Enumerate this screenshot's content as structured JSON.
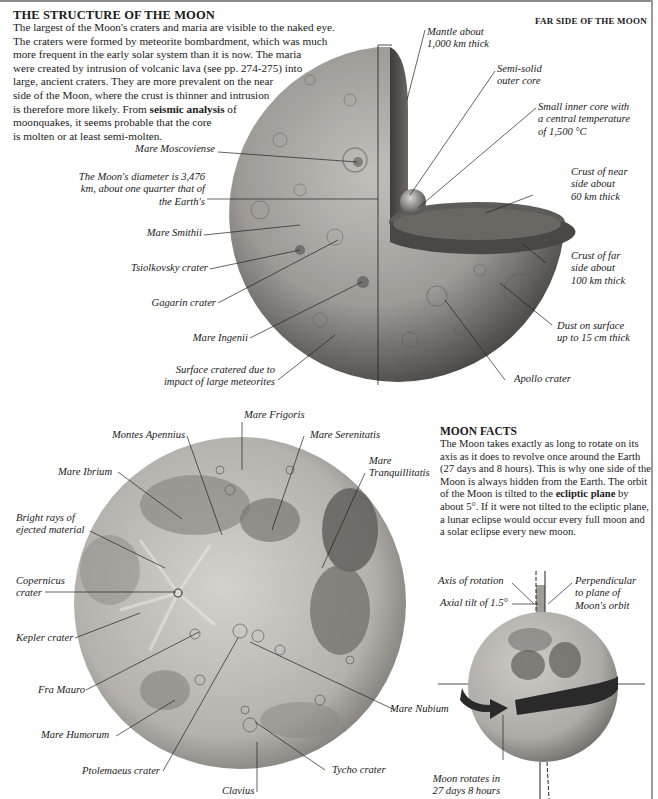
{
  "header": {
    "title": "THE STRUCTURE OF THE MOON",
    "intro_lines": [
      "The largest of the Moon's craters and maria are visible to the naked eye.",
      "The craters were formed by meteorite bombardment, which was much",
      "more frequent in the early solar system than it is now. The maria",
      "were created by intrusion of volcanic lava (see pp. 274-275) into",
      "large, ancient craters. They are more prevalent on the near",
      "side of the Moon, where the crust is thinner and intrusion",
      "is therefore more likely. From ",
      "seismic analysis",
      " of",
      "moonquakes, it seems probable that the core",
      "is molten or at least semi-molten."
    ],
    "far_side_title": "FAR SIDE OF THE MOON"
  },
  "far_side_labels": {
    "mantle": [
      "Mantle about",
      "1,000 km thick"
    ],
    "outer_core": [
      "Semi-solid",
      "outer core"
    ],
    "inner_core": [
      "Small inner core with",
      "a central temperature",
      "of 1,500 °C"
    ],
    "crust_near": [
      "Crust of near",
      "side about",
      "60 km thick"
    ],
    "crust_far": [
      "Crust of far",
      "side about",
      "100 km thick"
    ],
    "dust": [
      "Dust on surface",
      "up to 15 cm thick"
    ],
    "apollo": "Apollo crater",
    "moscoviense": "Mare Moscoviense",
    "diameter": [
      "The Moon's diameter is 3,476",
      "km, about one quarter that of",
      "the Earth's"
    ],
    "smithii": "Mare Smithii",
    "tsiolkovsky": "Tsiolkovsky crater",
    "gagarin": "Gagarin crater",
    "ingenii": "Mare Ingenii",
    "surface": [
      "Surface cratered due to",
      "impact of large meteorites"
    ]
  },
  "near_side_labels": {
    "frigoris": "Mare Frigoris",
    "apennius": "Montes Apennius",
    "serenitatis": "Mare Serenitatis",
    "tranquillitatis": [
      "Mare",
      "Tranquillitatis"
    ],
    "ibrium": "Mare Ibrium",
    "rays": [
      "Bright rays of",
      "ejected material"
    ],
    "copernicus": [
      "Copernicus",
      "crater"
    ],
    "kepler": "Kepler crater",
    "fra_mauro": "Fra Mauro",
    "nubium": "Mare Nubium",
    "humorum": "Mare Humorum",
    "ptolemaeus": "Ptolemaeus crater",
    "tycho": "Tycho crater",
    "clavius": "Clavius"
  },
  "facts": {
    "title": "MOON FACTS",
    "text_before": "The Moon takes exactly as long to rotate on its axis as it does to revolve once around the Earth (27 days and 8 hours). This is why one side of the Moon is always hidden from the Earth. The orbit of the Moon is tilted to the ",
    "bold": "ecliptic plane",
    "text_after": " by about 5°. If it were not tilted to the ecliptic plane, a lunar eclipse would occur every full moon and a solar eclipse every new moon."
  },
  "rotation_labels": {
    "axis": "Axis of rotation",
    "perpendicular": [
      "Perpendicular",
      "to plane of",
      "Moon's orbit"
    ],
    "tilt": "Axial tilt of 1.5°",
    "rotates": [
      "Moon rotates in",
      "27 days 8 hours"
    ]
  },
  "colors": {
    "moon_light": "#c9c6c1",
    "moon_mid": "#9b9894",
    "moon_dark": "#4e4c4a",
    "mare": "#6f6c69",
    "arrow": "#2a2a2a",
    "frame": "#8a8a8a"
  }
}
